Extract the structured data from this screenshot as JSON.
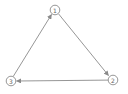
{
  "diagram": {
    "type": "directed-graph",
    "nodes": [
      {
        "id": "1",
        "label": "1",
        "x": 55,
        "y": 10
      },
      {
        "id": "2",
        "label": "2",
        "x": 113,
        "y": 80
      },
      {
        "id": "3",
        "label": "3",
        "x": 11,
        "y": 81
      }
    ],
    "edges": [
      {
        "from": "1",
        "to": "2"
      },
      {
        "from": "2",
        "to": "3"
      },
      {
        "from": "3",
        "to": "1"
      }
    ],
    "colors": {
      "stroke": "#8a8a8a",
      "text": "#666666",
      "background": "#ffffff"
    }
  }
}
